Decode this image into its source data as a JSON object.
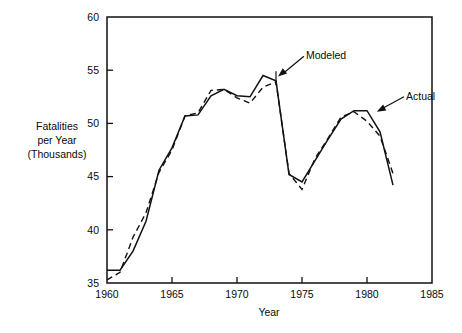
{
  "chart_data": {
    "type": "line",
    "title": "",
    "subtitle": "",
    "xlabel": "Year",
    "ylabel": "Fatalities per Year (Thousands)",
    "ylabel_lines": [
      "Fatalities",
      "per Year",
      "(Thousands)"
    ],
    "xlim": [
      1960,
      1985
    ],
    "ylim": [
      35,
      60
    ],
    "xticks": [
      1960,
      1965,
      1970,
      1975,
      1980,
      1985
    ],
    "xticklabels": [
      "1960",
      "1965",
      "1970",
      "1975",
      "1980",
      "1985"
    ],
    "yticks": [
      35,
      40,
      45,
      50,
      55,
      60
    ],
    "yticklabels": [
      "35",
      "40",
      "45",
      "50",
      "55",
      "60"
    ],
    "grid": false,
    "legend_position": "inline-annotations",
    "annotations": [
      {
        "text": "Modeled",
        "target_x": 1973.0,
        "target_y": 54.4,
        "label_x": 1975.3,
        "label_y": 56.4
      },
      {
        "text": "Actual",
        "target_x": 1980.6,
        "target_y": 51.1,
        "label_x": 1983.0,
        "label_y": 52.6
      }
    ],
    "series": [
      {
        "name": "Actual",
        "style": "solid",
        "x": [
          1960,
          1961,
          1962,
          1963,
          1964,
          1965,
          1966,
          1967,
          1968,
          1969,
          1970,
          1971,
          1972,
          1973,
          1974,
          1975,
          1976,
          1977,
          1978,
          1979,
          1980,
          1981,
          1982
        ],
        "values": [
          36.2,
          36.2,
          38.0,
          40.8,
          45.6,
          47.7,
          50.7,
          50.8,
          52.6,
          53.2,
          52.6,
          52.5,
          54.5,
          54.0,
          45.2,
          44.5,
          46.5,
          48.5,
          50.4,
          51.2,
          51.2,
          49.2,
          44.2
        ]
      },
      {
        "name": "Modeled",
        "style": "dashed",
        "x": [
          1960,
          1961,
          1962,
          1963,
          1964,
          1965,
          1966,
          1967,
          1968,
          1969,
          1970,
          1971,
          1972,
          1973,
          1974,
          1975,
          1976,
          1977,
          1978,
          1979,
          1980,
          1981,
          1982
        ],
        "values": [
          35.3,
          36.0,
          39.3,
          41.6,
          45.4,
          47.5,
          50.7,
          51.0,
          53.1,
          53.2,
          52.4,
          51.9,
          53.4,
          53.9,
          45.3,
          43.8,
          46.7,
          48.6,
          50.6,
          51.1,
          50.2,
          48.8,
          45.3
        ]
      }
    ]
  },
  "axes_geometry": {
    "plot_left_px": 107,
    "plot_right_px": 432,
    "plot_top_px": 17,
    "plot_bottom_px": 283
  }
}
